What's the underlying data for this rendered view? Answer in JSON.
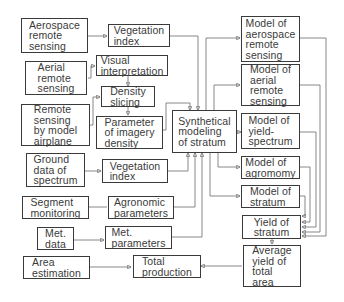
{
  "diagram": {
    "nodes": {
      "aerospace_remote_sensing": "Aerospace\nremote\nsensing",
      "vegetation_index_1": "Vegetation\nindex",
      "aerial_remote_sensing": "Aerial\nremote\nsensing",
      "visual_interpretation": "Visual\ninterpretation",
      "density_slicing": "Density\nslicing",
      "remote_sensing_model_airplane": "Remote\nsensing\nby model\nairplane",
      "parameter_imagery_density": "Parameter\nof imagery\ndensity",
      "synthetical_modeling": "Synthetical\nmodeling\nof stratum",
      "ground_data_spectrum": "Ground\ndata of\nspectrum",
      "vegetation_index_2": "Vegetation\nindex",
      "segment_monitoring": "Segment\nmonitoring",
      "agronomic_parameters": "Agronomic\nparameters",
      "met_data": "Met.\ndata",
      "met_parameters": "Met.\nparameters",
      "area_estimation": "Area\nestimation",
      "total_production": "Total\nproduction",
      "model_aerospace": "Model of\naerospace\nremote\nsensing",
      "model_aerial": "Model of\naerial\nremote\nsensing",
      "model_yield_spectrum": "Model of\nyield-\nspectrum",
      "model_agromomy": "Model of\nagromomy",
      "model_stratum": "Model of\nstratum",
      "yield_of_stratum": "Yield of\nstratum",
      "average_yield": "Average\nyield of\ntotal\narea"
    },
    "edges": [
      [
        "Aerospace remote sensing",
        "Vegetation index"
      ],
      [
        "Aerial remote sensing",
        "Visual interpretation"
      ],
      [
        "Visual interpretation",
        "Density slicing"
      ],
      [
        "Remote sensing by model airplane",
        "Density slicing"
      ],
      [
        "Density slicing",
        "Parameter of imagery density"
      ],
      [
        "Parameter of imagery density",
        "Synthetical modeling of stratum"
      ],
      [
        "Vegetation index",
        "Synthetical modeling of stratum"
      ],
      [
        "Ground data of spectrum",
        "Vegetation index"
      ],
      [
        "Vegetation index (ground)",
        "Synthetical modeling of stratum"
      ],
      [
        "Segment monitoring",
        "Agronomic parameters"
      ],
      [
        "Agronomic parameters",
        "Synthetical modeling of stratum"
      ],
      [
        "Met. data",
        "Met. parameters"
      ],
      [
        "Met. parameters",
        "Synthetical modeling of stratum"
      ],
      [
        "Synthetical modeling of stratum",
        "Model of aerospace remote sensing"
      ],
      [
        "Synthetical modeling of stratum",
        "Model of aerial remote sensing"
      ],
      [
        "Synthetical modeling of stratum",
        "Model of yield-spectrum"
      ],
      [
        "Synthetical modeling of stratum",
        "Model of agromomy"
      ],
      [
        "Synthetical modeling of stratum",
        "Model of stratum"
      ],
      [
        "Model of aerospace remote sensing",
        "Yield of stratum"
      ],
      [
        "Model of aerial remote sensing",
        "Yield of stratum"
      ],
      [
        "Model of yield-spectrum",
        "Yield of stratum"
      ],
      [
        "Model of agromomy",
        "Yield of stratum"
      ],
      [
        "Model of stratum",
        "Yield of stratum"
      ],
      [
        "Yield of stratum",
        "Average yield of total area"
      ],
      [
        "Area estimation",
        "Total production"
      ],
      [
        "Average yield of total area",
        "Total production"
      ]
    ]
  }
}
